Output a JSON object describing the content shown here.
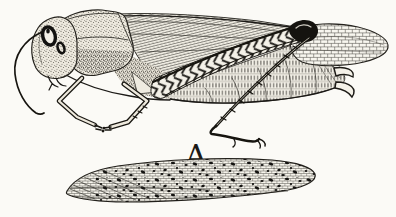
{
  "figure": {
    "label": "A",
    "style": "black ink engraving on paper"
  },
  "colors": {
    "paper": "#fbfaf6",
    "ink": "#1b1916"
  }
}
